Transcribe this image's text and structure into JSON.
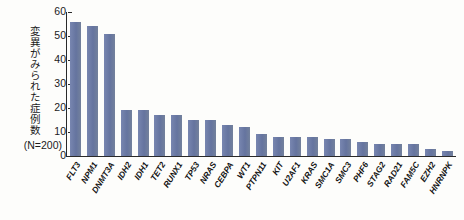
{
  "chart_data": {
    "type": "bar",
    "title": "",
    "xlabel": "",
    "ylabel": "変異がみられた症例数",
    "ylabel_note": "(N=200)",
    "ylim": [
      0,
      60
    ],
    "yticks": [
      0,
      10,
      20,
      30,
      40,
      50,
      60
    ],
    "grid": false,
    "legend": "none",
    "bar_color": "#6b7aa8",
    "axis_color": "#2a2a2a",
    "categories": [
      "FLT3",
      "NPM1",
      "DNMT3A",
      "IDH2",
      "IDH1",
      "TET2",
      "RUNX1",
      "TP53",
      "NRAS",
      "CEBPA",
      "WT1",
      "PTPN11",
      "KIT",
      "U2AF1",
      "KRAS",
      "SMC1A",
      "SMC3",
      "PHF6",
      "STAG2",
      "RAD21",
      "FAM5C",
      "EZH2",
      "HNRNPK"
    ],
    "values": [
      56,
      54,
      51,
      19,
      19,
      17,
      17,
      15,
      15,
      13,
      12,
      9,
      8,
      8,
      8,
      7,
      7,
      6,
      5,
      5,
      5,
      3,
      2
    ]
  }
}
